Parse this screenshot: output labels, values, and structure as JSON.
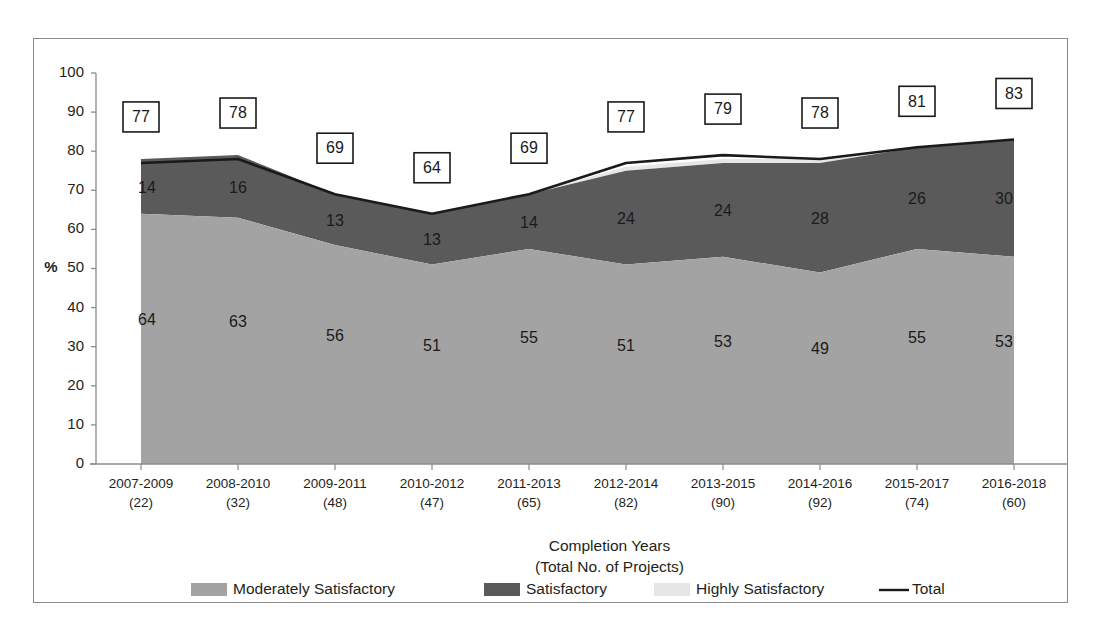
{
  "chart_data": {
    "type": "area",
    "title": "",
    "subtitle": "",
    "stacked": true,
    "xlabel": "Completion Years",
    "xlabel_line2": "(Total No. of Projects)",
    "ylabel": "%",
    "ylim": [
      0,
      100
    ],
    "yticks": [
      0,
      10,
      20,
      30,
      40,
      50,
      60,
      70,
      80,
      90,
      100
    ],
    "ytick_labels": [
      "0",
      "10",
      "20",
      "30",
      "40",
      "50",
      "60",
      "70",
      "80",
      "90",
      "100"
    ],
    "grid": false,
    "legend_position": "bottom",
    "categories": [
      "2007-2009",
      "2008-2010",
      "2009-2011",
      "2010-2012",
      "2011-2013",
      "2012-2014",
      "2013-2015",
      "2014-2016",
      "2015-2017",
      "2016-2018"
    ],
    "category_sublabels": [
      "(22)",
      "(32)",
      "(48)",
      "(47)",
      "(65)",
      "(82)",
      "(90)",
      "(92)",
      "(74)",
      "(60)"
    ],
    "series": [
      {
        "name": "Moderately Satisfactory",
        "color": "#a3a3a3",
        "values": [
          64,
          63,
          56,
          51,
          55,
          51,
          53,
          49,
          55,
          53
        ],
        "labels": [
          "64",
          "63",
          "56",
          "51",
          "55",
          "51",
          "53",
          "49",
          "55",
          "53"
        ]
      },
      {
        "name": "Satisfactory",
        "color": "#5a5a5a",
        "values": [
          14,
          16,
          13,
          13,
          14,
          24,
          24,
          28,
          26,
          30
        ],
        "labels": [
          "14",
          "16",
          "13",
          "13",
          "14",
          "24",
          "24",
          "28",
          "26",
          "30"
        ]
      },
      {
        "name": "Highly Satisfactory",
        "color": "#e6e6e6",
        "values": [
          0,
          0,
          0,
          0,
          0,
          1,
          1,
          1,
          0,
          0
        ],
        "labels": [
          "",
          "",
          "",
          "",
          "",
          "1",
          "1",
          "1",
          "",
          ""
        ]
      }
    ],
    "total_line": {
      "name": "Total",
      "color": "#1a1a1a",
      "values": [
        77,
        78,
        69,
        64,
        69,
        77,
        79,
        78,
        81,
        83
      ],
      "labels": [
        "77",
        "78",
        "69",
        "64",
        "69",
        "77",
        "79",
        "78",
        "81",
        "83"
      ],
      "label_boxed": true
    },
    "legend": [
      {
        "label": "Moderately Satisfactory",
        "swatch": "#a3a3a3",
        "kind": "area"
      },
      {
        "label": "Satisfactory",
        "swatch": "#5a5a5a",
        "kind": "area"
      },
      {
        "label": "Highly Satisfactory",
        "swatch": "#e6e6e6",
        "kind": "area"
      },
      {
        "label": "Total",
        "swatch": "#1a1a1a",
        "kind": "line"
      }
    ]
  },
  "frame": {
    "border_color": "#8a8a8a",
    "background": "#ffffff"
  }
}
